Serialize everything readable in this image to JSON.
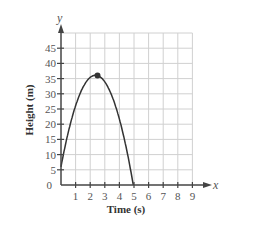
{
  "chart_data": {
    "type": "line",
    "title": "",
    "xlabel": "Time (s)",
    "ylabel": "Height (m)",
    "x_axis_var": "x",
    "y_axis_var": "y",
    "xlim": [
      0,
      9
    ],
    "ylim": [
      0,
      50
    ],
    "x_ticks": [
      "1",
      "2",
      "3",
      "4",
      "5",
      "6",
      "7",
      "8",
      "9"
    ],
    "y_ticks": [
      "0",
      "5",
      "10",
      "15",
      "20",
      "25",
      "30",
      "35",
      "40",
      "45"
    ],
    "grid": true,
    "series": [
      {
        "name": "height",
        "x": [
          0,
          0.5,
          1,
          1.5,
          2,
          2.5,
          3,
          3.5,
          4,
          4.5,
          4.95
        ],
        "values": [
          6,
          17.4,
          26.1,
          32.1,
          35.4,
          36,
          33.9,
          29.1,
          19.7,
          9.4,
          0
        ],
        "color": "#333333"
      }
    ],
    "annotations": [
      {
        "type": "point",
        "x": 2.5,
        "y": 36,
        "label": "maximum"
      }
    ]
  }
}
